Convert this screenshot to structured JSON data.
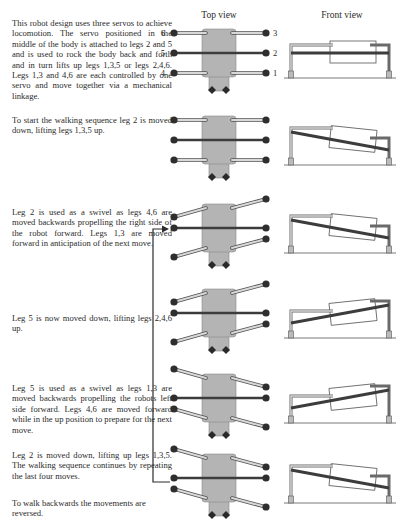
{
  "headers": {
    "top_view": "Top view",
    "front_view": "Front view"
  },
  "leg_labels": {
    "left": [
      "6",
      "5",
      "4"
    ],
    "right": [
      "3",
      "2",
      "1"
    ]
  },
  "paragraphs": [
    "This robot design uses three servos to achieve locomotion. The servo positioned in the middle of the body is attached to legs 2 and 5 and is used to rock the body back and forth and in turn lifts up legs 1,3,5 or legs 2,4,6. Legs 1,3 and 4,6 are each controlled by one servo and move together via a mechanical linkage.",
    "To start the walking sequence leg 2 is moved down, lifting legs 1,3,5 up.",
    "Leg 2 is used as a swivel as legs 4,6 are moved backwards propelling the right side of the robot forward. Legs 1,3 are moved forward in anticipation of the next move.",
    "Leg 5 is now moved down, lifting legs 2,4,6 up.",
    "Leg 5 is used as a swivel as legs 1,3 are moved backwards propelling the robots left side forward. Legs 4,6 are moved forward while in the up position to prepare for the next move.",
    "Leg 2 is moved down, lifting up legs 1,3,5. The walking sequence continues by repeating the last four moves.",
    "To walk backwards the movements are reversed."
  ],
  "frames": [
    {
      "step": 1,
      "tilt": "level",
      "left_legs": "straight",
      "right_legs": "straight"
    },
    {
      "step": 2,
      "tilt": "right-down",
      "left_legs": "straight",
      "right_legs": "straight"
    },
    {
      "step": 3,
      "tilt": "right-down",
      "left_legs": "back",
      "right_legs": "forward"
    },
    {
      "step": 4,
      "tilt": "left-down",
      "left_legs": "back",
      "right_legs": "forward"
    },
    {
      "step": 5,
      "tilt": "left-down",
      "left_legs": "forward",
      "right_legs": "back"
    },
    {
      "step": 6,
      "tilt": "right-down",
      "left_legs": "forward",
      "right_legs": "back"
    }
  ],
  "colors": {
    "body": "#b4b4b4",
    "dark_leg": "#3c3c3c",
    "light_leg": "#d8d8d8",
    "text": "#2a2a2a"
  }
}
